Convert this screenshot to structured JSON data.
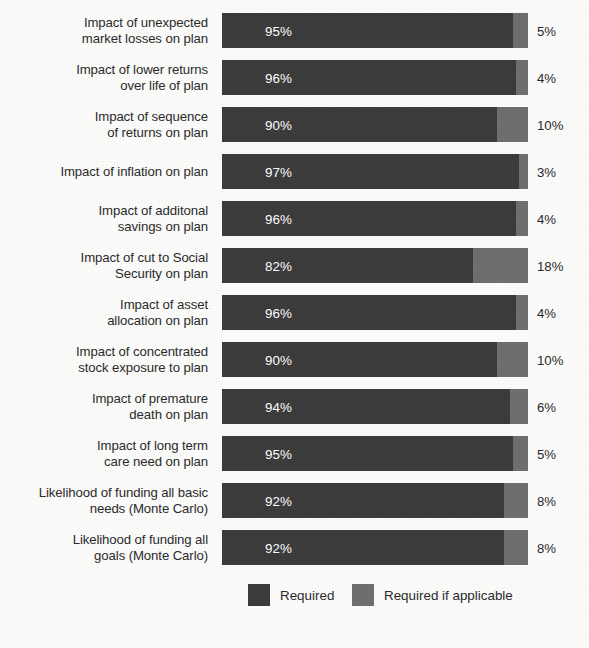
{
  "chart_data": {
    "type": "bar",
    "subtype": "stacked-horizontal-100",
    "title": "",
    "xlabel": "",
    "ylabel": "",
    "xlim": [
      0,
      100
    ],
    "grid": false,
    "legend_position": "bottom-center",
    "categories": [
      "Impact of unexpected\nmarket losses on plan",
      "Impact of lower returns\nover life of plan",
      "Impact of sequence\nof returns on plan",
      "Impact of inflation on plan",
      "Impact of additonal\nsavings on plan",
      "Impact of cut to Social\nSecurity on plan",
      "Impact of asset\nallocation on plan",
      "Impact of concentrated\nstock exposure to plan",
      "Impact of premature\ndeath on plan",
      "Impact of long term\ncare need on plan",
      "Likelihood of funding all basic\nneeds (Monte Carlo)",
      "Likelihood of funding all\ngoals (Monte Carlo)"
    ],
    "series": [
      {
        "name": "Required",
        "color": "#3c3c3c",
        "values": [
          95,
          96,
          90,
          97,
          96,
          82,
          96,
          90,
          94,
          95,
          92,
          92
        ],
        "value_labels": [
          "95%",
          "96%",
          "90%",
          "97%",
          "96%",
          "82%",
          "96%",
          "90%",
          "94%",
          "95%",
          "92%",
          "92%"
        ]
      },
      {
        "name": "Required if applicable",
        "color": "#6f6f6f",
        "values": [
          5,
          4,
          10,
          3,
          4,
          18,
          4,
          10,
          6,
          5,
          8,
          8
        ],
        "value_labels": [
          "5%",
          "4%",
          "10%",
          "3%",
          "4%",
          "18%",
          "4%",
          "10%",
          "6%",
          "5%",
          "8%",
          "8%"
        ]
      }
    ]
  },
  "rows": [
    {
      "label": "Impact of unexpected\nmarket losses on plan",
      "primary_pct": 95,
      "primary_label": "95%",
      "secondary_label": "5%"
    },
    {
      "label": "Impact of lower returns\nover life of plan",
      "primary_pct": 96,
      "primary_label": "96%",
      "secondary_label": "4%"
    },
    {
      "label": "Impact of sequence\nof returns on plan",
      "primary_pct": 90,
      "primary_label": "90%",
      "secondary_label": "10%"
    },
    {
      "label": "Impact of inflation on plan",
      "primary_pct": 97,
      "primary_label": "97%",
      "secondary_label": "3%"
    },
    {
      "label": "Impact of additonal\nsavings on plan",
      "primary_pct": 96,
      "primary_label": "96%",
      "secondary_label": "4%"
    },
    {
      "label": "Impact of cut to Social\nSecurity on plan",
      "primary_pct": 82,
      "primary_label": "82%",
      "secondary_label": "18%"
    },
    {
      "label": "Impact of asset\nallocation on plan",
      "primary_pct": 96,
      "primary_label": "96%",
      "secondary_label": "4%"
    },
    {
      "label": "Impact of concentrated\nstock exposure to plan",
      "primary_pct": 90,
      "primary_label": "90%",
      "secondary_label": "10%"
    },
    {
      "label": "Impact of premature\ndeath on plan",
      "primary_pct": 94,
      "primary_label": "94%",
      "secondary_label": "6%"
    },
    {
      "label": "Impact of long term\ncare need on plan",
      "primary_pct": 95,
      "primary_label": "95%",
      "secondary_label": "5%"
    },
    {
      "label": "Likelihood of funding all basic\nneeds (Monte Carlo)",
      "primary_pct": 92,
      "primary_label": "92%",
      "secondary_label": "8%"
    },
    {
      "label": "Likelihood of funding all\ngoals (Monte Carlo)",
      "primary_pct": 92,
      "primary_label": "92%",
      "secondary_label": "8%"
    }
  ],
  "legend": {
    "items": [
      {
        "label": "Required",
        "color": "#3c3c3c"
      },
      {
        "label": "Required if applicable",
        "color": "#6f6f6f"
      }
    ]
  },
  "colors": {
    "background": "#fcfcfb",
    "text": "#2b2b2b",
    "series_required": "#3c3c3c",
    "series_required_if_applicable": "#6f6f6f",
    "value_label_on_bar": "#ffffff"
  }
}
